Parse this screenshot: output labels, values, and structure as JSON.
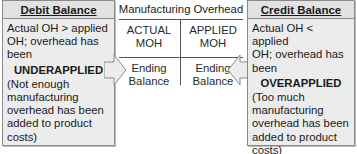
{
  "left_box": {
    "header": "Debit Balance",
    "line1": "Actual OH > applied",
    "line2": "OH; overhead has",
    "line3": "been",
    "state": "UNDERAPPLIED",
    "note1": "(Not enough",
    "note2": "manufacturing",
    "note3": "overhead has been",
    "note4": "added to product",
    "note5": "costs)"
  },
  "t_account": {
    "title": "Manufacturing Overhead",
    "left_top_1": "ACTUAL",
    "left_top_2": "MOH",
    "right_top_1": "APPLIED",
    "right_top_2": "MOH",
    "left_bottom_1": "Ending",
    "left_bottom_2": "Balance",
    "right_bottom_1": "Ending",
    "right_bottom_2": "Balance"
  },
  "right_box": {
    "header": "Credit Balance",
    "line1": "Actual OH < applied",
    "line2": "OH; overhead has",
    "line3": "been",
    "state": "OVERAPPLIED",
    "note1": "(Too much",
    "note2": "manufacturing",
    "note3": "overhead has been",
    "note4": "added to product",
    "note5": "costs)"
  },
  "colors": {
    "box_fill": "#ececec",
    "box_border": "#8a8a8a",
    "t_lines": "#555555"
  }
}
